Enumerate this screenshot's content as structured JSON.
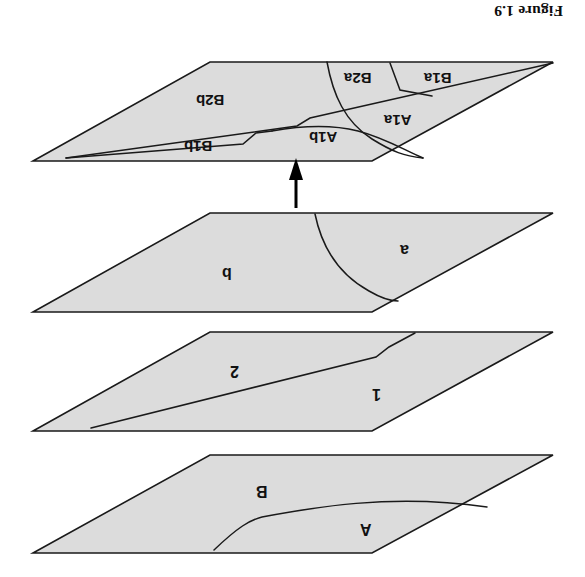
{
  "figure": {
    "title": "Figure 1.9",
    "orientation": "rotated-180",
    "background_color": "#ffffff",
    "plane_fill_color": "#dcdcdc",
    "plane_stroke_color": "#1a1a1a",
    "label_color": "#111111"
  },
  "planes": [
    {
      "name": "top-plane",
      "order": 1,
      "regions": [
        {
          "label": "B1a"
        },
        {
          "label": "B2a"
        },
        {
          "label": "B2b"
        },
        {
          "label": "B1b"
        },
        {
          "label": "A1a"
        },
        {
          "label": "A1b"
        }
      ]
    },
    {
      "name": "second-plane",
      "order": 2,
      "regions": [
        {
          "label": "a"
        },
        {
          "label": "b"
        }
      ]
    },
    {
      "name": "third-plane",
      "order": 3,
      "regions": [
        {
          "label": "1"
        },
        {
          "label": "2"
        }
      ]
    },
    {
      "name": "bottom-plane",
      "order": 4,
      "regions": [
        {
          "label": "A"
        },
        {
          "label": "B"
        }
      ]
    }
  ],
  "arrow": {
    "name": "upward-arrow",
    "direction": "up",
    "from_plane": "second-plane",
    "to_plane": "top-plane"
  }
}
